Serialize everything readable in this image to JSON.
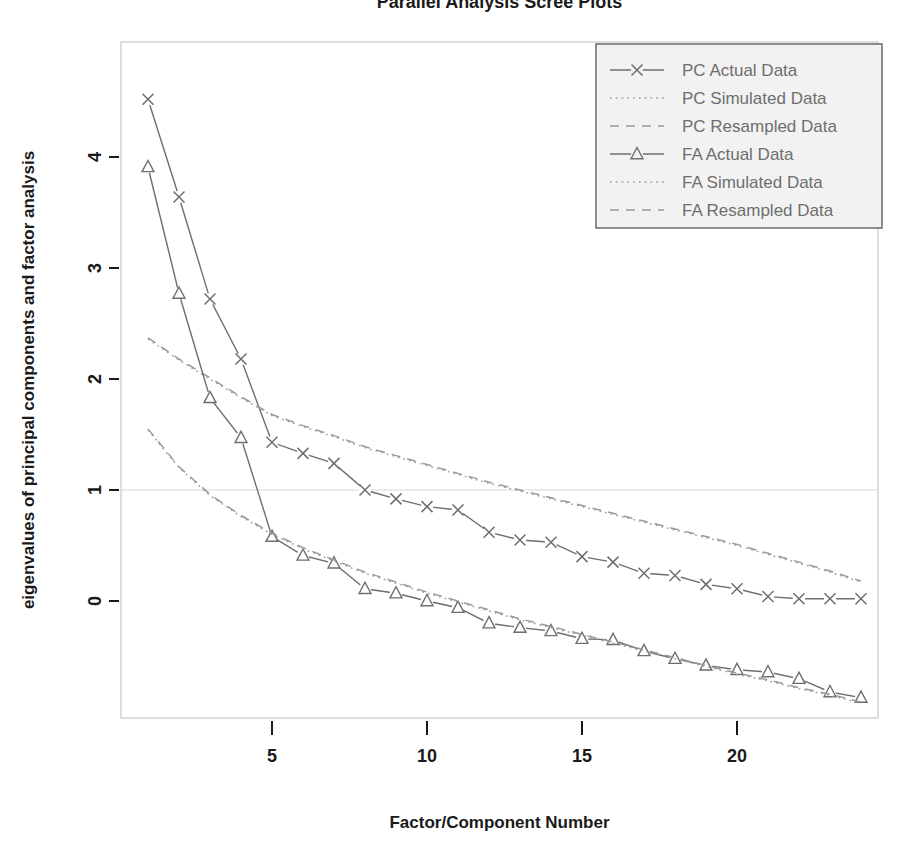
{
  "chart_data": {
    "type": "line",
    "title": "Parallel Analysis Scree Plots",
    "xlabel": "Factor/Component Number",
    "ylabel": "eigenvalues of principal components and factor analysis",
    "xlim": [
      1,
      24
    ],
    "ylim": [
      -0.95,
      4.75
    ],
    "xticks": [
      5,
      10,
      15,
      20
    ],
    "yticks": [
      0,
      1,
      2,
      3,
      4
    ],
    "grid": false,
    "reference_line": {
      "y": 1,
      "style": "solid",
      "color": "#d8d8d8"
    },
    "legend_position": "top-right",
    "x": [
      1,
      2,
      3,
      4,
      5,
      6,
      7,
      8,
      9,
      10,
      11,
      12,
      13,
      14,
      15,
      16,
      17,
      18,
      19,
      20,
      21,
      22,
      23,
      24
    ],
    "series": [
      {
        "name": "PC  Actual Data",
        "key": "pc_actual",
        "marker": "x",
        "linestyle": "solid",
        "color": "#6e6e6e",
        "values": [
          4.52,
          3.64,
          2.72,
          2.18,
          1.43,
          1.33,
          1.24,
          1.0,
          0.92,
          0.85,
          0.82,
          0.62,
          0.55,
          0.53,
          0.4,
          0.35,
          0.25,
          0.23,
          0.15,
          0.11,
          0.04,
          0.02,
          0.02,
          0.02
        ]
      },
      {
        "name": "PC  Simulated Data",
        "key": "pc_simulated",
        "marker": "none",
        "linestyle": "dotted",
        "color": "#9a9a9a",
        "values": [
          2.36,
          2.17,
          2.0,
          1.83,
          1.67,
          1.57,
          1.48,
          1.38,
          1.3,
          1.22,
          1.14,
          1.06,
          0.99,
          0.92,
          0.85,
          0.78,
          0.71,
          0.64,
          0.57,
          0.5,
          0.42,
          0.34,
          0.26,
          0.17
        ]
      },
      {
        "name": "PC  Resampled Data",
        "key": "pc_resampled",
        "marker": "none",
        "linestyle": "dashed",
        "color": "#9a9a9a",
        "values": [
          2.37,
          2.18,
          2.01,
          1.84,
          1.68,
          1.58,
          1.49,
          1.39,
          1.31,
          1.23,
          1.15,
          1.07,
          1.0,
          0.93,
          0.86,
          0.79,
          0.72,
          0.65,
          0.58,
          0.51,
          0.43,
          0.35,
          0.27,
          0.18
        ]
      },
      {
        "name": "FA  Actual Data",
        "key": "fa_actual",
        "marker": "triangle",
        "linestyle": "solid",
        "color": "#6e6e6e",
        "values": [
          3.91,
          2.77,
          1.83,
          1.47,
          0.58,
          0.41,
          0.34,
          0.11,
          0.07,
          0.0,
          -0.06,
          -0.2,
          -0.24,
          -0.27,
          -0.34,
          -0.35,
          -0.45,
          -0.52,
          -0.58,
          -0.62,
          -0.64,
          -0.7,
          -0.82,
          -0.87
        ]
      },
      {
        "name": "FA  Simulated Data",
        "key": "fa_simulated",
        "marker": "none",
        "linestyle": "dotted",
        "color": "#9a9a9a",
        "values": [
          1.54,
          1.2,
          0.95,
          0.76,
          0.6,
          0.47,
          0.36,
          0.25,
          0.16,
          0.07,
          -0.01,
          -0.09,
          -0.17,
          -0.24,
          -0.31,
          -0.38,
          -0.45,
          -0.52,
          -0.59,
          -0.66,
          -0.72,
          -0.79,
          -0.85,
          -0.92
        ]
      },
      {
        "name": "FA  Resampled Data",
        "key": "fa_resampled",
        "marker": "none",
        "linestyle": "dashed",
        "color": "#9a9a9a",
        "values": [
          1.55,
          1.21,
          0.96,
          0.77,
          0.61,
          0.48,
          0.37,
          0.26,
          0.17,
          0.08,
          0.0,
          -0.08,
          -0.16,
          -0.23,
          -0.3,
          -0.37,
          -0.44,
          -0.51,
          -0.58,
          -0.65,
          -0.71,
          -0.78,
          -0.84,
          -0.91
        ]
      }
    ]
  },
  "legend": {
    "entries": [
      {
        "label": "PC  Actual Data",
        "marker": "x",
        "linestyle": "solid"
      },
      {
        "label": "PC  Simulated Data",
        "marker": "none",
        "linestyle": "dotted"
      },
      {
        "label": "PC  Resampled Data",
        "marker": "none",
        "linestyle": "dashed"
      },
      {
        "label": "FA  Actual Data",
        "marker": "triangle",
        "linestyle": "solid"
      },
      {
        "label": "FA  Simulated Data",
        "marker": "none",
        "linestyle": "dotted"
      },
      {
        "label": "FA  Resampled Data",
        "marker": "none",
        "linestyle": "dashed"
      }
    ]
  },
  "colors": {
    "actual": "#6e6e6e",
    "reference": "#9a9a9a",
    "frame": "#c8c8c8",
    "text": "#1a1a1a",
    "legend_text": "#6e6e6e",
    "legend_bg": "#f2f2f2",
    "refline": "#d8d8d8"
  }
}
